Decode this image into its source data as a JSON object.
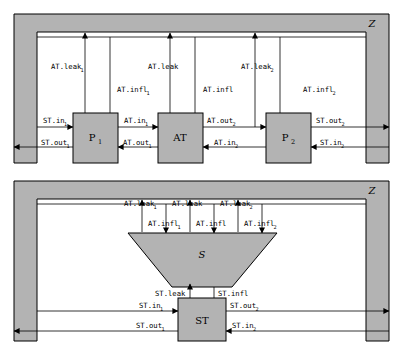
{
  "diagram": {
    "panels": [
      {
        "id": "top-panel",
        "environment_label": "Z",
        "blocks": [
          {
            "id": "p1",
            "label": "P",
            "subscript": "1"
          },
          {
            "id": "at",
            "label": "AT",
            "subscript": ""
          },
          {
            "id": "p2",
            "label": "P",
            "subscript": "2"
          }
        ],
        "vertical_labels": [
          {
            "id": "at-leak-1",
            "label": "AT.leak",
            "subscript": "1"
          },
          {
            "id": "at-infl-1",
            "label": "AT.infl",
            "subscript": "1"
          },
          {
            "id": "at-leak-mid",
            "label": "AT.leak",
            "subscript": ""
          },
          {
            "id": "at-infl-mid",
            "label": "AT.infl",
            "subscript": ""
          },
          {
            "id": "at-leak-2",
            "label": "AT.leak",
            "subscript": "2"
          },
          {
            "id": "at-infl-2",
            "label": "AT.infl",
            "subscript": "2"
          }
        ],
        "horizontal_labels": [
          {
            "id": "st-in-1",
            "label": "ST.in",
            "subscript": "1"
          },
          {
            "id": "at-in-1",
            "label": "AT.in",
            "subscript": "1"
          },
          {
            "id": "at-out-2",
            "label": "AT.out",
            "subscript": "2"
          },
          {
            "id": "st-out-2",
            "label": "ST.out",
            "subscript": "2"
          },
          {
            "id": "st-out-1",
            "label": "ST.out",
            "subscript": "1"
          },
          {
            "id": "at-out-1",
            "label": "AT.out",
            "subscript": "1"
          },
          {
            "id": "at-in-2",
            "label": "AT.in",
            "subscript": "2"
          },
          {
            "id": "st-in-2",
            "label": "ST.in",
            "subscript": "2"
          }
        ]
      },
      {
        "id": "bottom-panel",
        "environment_label": "Z",
        "blocks": [
          {
            "id": "s-trapezoid",
            "label": "S",
            "subscript": ""
          },
          {
            "id": "st",
            "label": "ST",
            "subscript": ""
          }
        ],
        "vertical_labels": [
          {
            "id": "b-at-leak-1",
            "label": "AT.leak",
            "subscript": "1"
          },
          {
            "id": "b-at-leak-mid",
            "label": "AT.leak",
            "subscript": ""
          },
          {
            "id": "b-at-leak-2",
            "label": "AT.leak",
            "subscript": "2"
          },
          {
            "id": "b-at-infl-1",
            "label": "AT.infl",
            "subscript": "1"
          },
          {
            "id": "b-at-infl-mid",
            "label": "AT.infl",
            "subscript": ""
          },
          {
            "id": "b-at-infl-2",
            "label": "AT.infl",
            "subscript": "2"
          },
          {
            "id": "b-st-leak",
            "label": "ST.leak",
            "subscript": ""
          },
          {
            "id": "b-st-infl",
            "label": "ST.infl",
            "subscript": ""
          }
        ],
        "horizontal_labels": [
          {
            "id": "b-st-in-1",
            "label": "ST.in",
            "subscript": "1"
          },
          {
            "id": "b-st-out-2",
            "label": "ST.out",
            "subscript": "2"
          },
          {
            "id": "b-st-out-1",
            "label": "ST.out",
            "subscript": "1"
          },
          {
            "id": "b-st-in-2",
            "label": "ST.in",
            "subscript": "2"
          }
        ]
      }
    ],
    "colors": {
      "block_fill": "#b3b3b3",
      "stroke": "#000000",
      "background": "#ffffff"
    }
  }
}
